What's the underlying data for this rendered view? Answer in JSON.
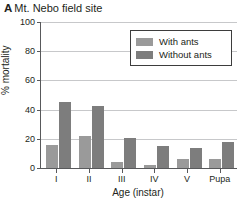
{
  "panel": {
    "letter": "A",
    "title": "Mt. Nebo field site"
  },
  "colors": {
    "with_ants": "#9a9a9a",
    "without_ants": "#7d7d7d",
    "axis": "#58595b",
    "grid": "#c7c8ca",
    "text": "#231f20"
  },
  "legend": {
    "items": [
      {
        "label": "With ants"
      },
      {
        "label": "Without ants"
      }
    ]
  },
  "axes": {
    "y_ticks": [
      "0",
      "20",
      "40",
      "60",
      "80",
      "100"
    ],
    "x_ticks": [
      "I",
      "II",
      "III",
      "IV",
      "V",
      "Pupa"
    ]
  },
  "chart_data": {
    "type": "bar",
    "xlabel": "Age (instar)",
    "ylabel": "% mortality",
    "categories": [
      "I",
      "II",
      "III",
      "IV",
      "V",
      "Pupa"
    ],
    "series": [
      {
        "name": "With ants",
        "values": [
          16,
          22,
          4,
          2,
          6,
          6.5
        ]
      },
      {
        "name": "Without ants",
        "values": [
          45.5,
          42.5,
          20.5,
          15,
          14,
          17.5
        ]
      }
    ],
    "ylim": [
      0,
      100
    ],
    "yticks": [
      0,
      20,
      40,
      60,
      80,
      100
    ],
    "grid": "horizontal",
    "legend_position": "top-right"
  }
}
